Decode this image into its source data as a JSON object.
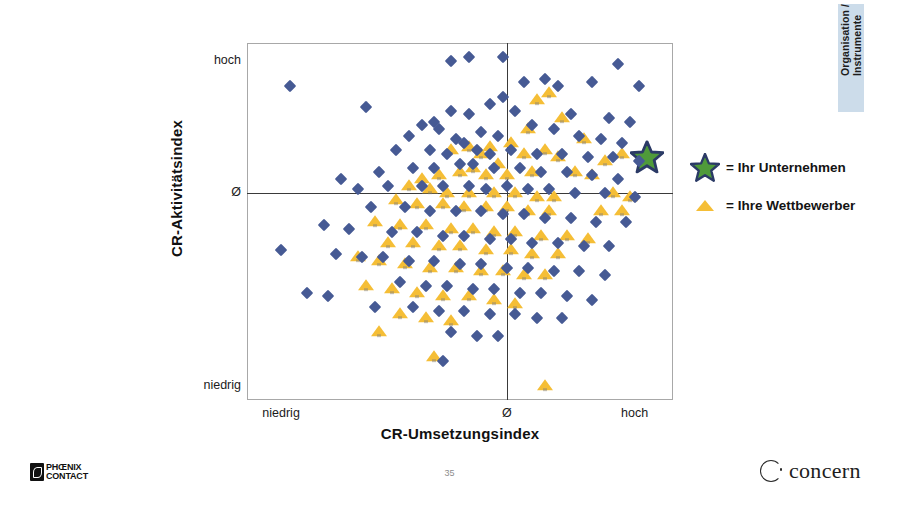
{
  "slide": {
    "page_number": "35",
    "side_tab_label": "Organisation /\nInstrumente",
    "side_tab_color": "#ccdcea"
  },
  "legend": {
    "items": [
      {
        "glyph": "star-icon",
        "label": "= Ihr Unternehmen"
      },
      {
        "glyph": "triangle-icon",
        "label": "= Ihre Wettbewerber"
      }
    ]
  },
  "footer": {
    "brand_left_line1": "PHŒNIX",
    "brand_left_line2": "CONTACT",
    "brand_right": "concern"
  },
  "colors": {
    "competitor": "#f5be36",
    "market": "#465a94",
    "own_company_fill": "#4f9a3a",
    "own_company_outline": "#2b3a66",
    "frame": "#a8a8a8",
    "axis": "#3a3a3a"
  },
  "chart_data": {
    "type": "scatter",
    "title": "",
    "xlabel": "CR-Umsetzungsindex",
    "ylabel": "CR-Aktivitätsindex",
    "xlim": [
      0,
      100
    ],
    "ylim": [
      0,
      100
    ],
    "grid": false,
    "legend_position": "right",
    "xticks": [
      {
        "value": 8,
        "label": "niedrig"
      },
      {
        "value": 61,
        "label": "Ø"
      },
      {
        "value": 91,
        "label": "hoch"
      }
    ],
    "yticks": [
      {
        "value": 95,
        "label": "hoch"
      },
      {
        "value": 58,
        "label": "Ø"
      },
      {
        "value": 4,
        "label": "niedrig"
      }
    ],
    "reference_lines": {
      "x": 61,
      "y": 58
    },
    "series": [
      {
        "name": "Ihr Unternehmen",
        "marker": "star",
        "color": "#4f9a3a",
        "points": [
          [
            94,
            68
          ]
        ]
      },
      {
        "name": "Ihre Wettbewerber",
        "marker": "triangle",
        "color": "#f5be36",
        "points": [
          [
            71,
            86
          ],
          [
            68,
            84
          ],
          [
            74,
            79
          ],
          [
            66,
            76
          ],
          [
            79,
            73
          ],
          [
            62,
            72
          ],
          [
            57,
            71
          ],
          [
            52,
            71
          ],
          [
            48,
            70
          ],
          [
            55,
            69
          ],
          [
            65,
            69
          ],
          [
            70,
            70
          ],
          [
            73,
            68
          ],
          [
            88,
            69
          ],
          [
            84,
            67
          ],
          [
            59,
            66
          ],
          [
            53,
            65
          ],
          [
            50,
            64
          ],
          [
            45,
            63
          ],
          [
            41,
            62
          ],
          [
            56,
            63
          ],
          [
            61,
            63
          ],
          [
            67,
            64
          ],
          [
            77,
            64
          ],
          [
            81,
            63
          ],
          [
            38,
            60
          ],
          [
            43,
            59
          ],
          [
            47,
            58
          ],
          [
            52,
            58
          ],
          [
            58,
            58
          ],
          [
            63,
            58
          ],
          [
            68,
            57
          ],
          [
            72,
            57
          ],
          [
            86,
            58
          ],
          [
            90,
            57
          ],
          [
            35,
            56
          ],
          [
            40,
            55
          ],
          [
            46,
            55
          ],
          [
            51,
            54
          ],
          [
            56,
            54
          ],
          [
            61,
            54
          ],
          [
            66,
            53
          ],
          [
            71,
            53
          ],
          [
            83,
            53
          ],
          [
            88,
            53
          ],
          [
            30,
            50
          ],
          [
            36,
            49
          ],
          [
            42,
            49
          ],
          [
            48,
            48
          ],
          [
            53,
            48
          ],
          [
            58,
            47
          ],
          [
            63,
            47
          ],
          [
            69,
            46
          ],
          [
            75,
            46
          ],
          [
            80,
            45
          ],
          [
            33,
            44
          ],
          [
            39,
            44
          ],
          [
            45,
            43
          ],
          [
            50,
            43
          ],
          [
            56,
            42
          ],
          [
            62,
            42
          ],
          [
            67,
            41
          ],
          [
            73,
            41
          ],
          [
            26,
            40
          ],
          [
            31,
            39
          ],
          [
            37,
            38
          ],
          [
            43,
            37
          ],
          [
            49,
            37
          ],
          [
            55,
            36
          ],
          [
            60,
            36
          ],
          [
            65,
            35
          ],
          [
            70,
            35
          ],
          [
            28,
            32
          ],
          [
            34,
            31
          ],
          [
            40,
            30
          ],
          [
            46,
            29
          ],
          [
            52,
            29
          ],
          [
            58,
            28
          ],
          [
            63,
            27
          ],
          [
            36,
            24
          ],
          [
            42,
            23
          ],
          [
            48,
            22
          ],
          [
            31,
            19
          ],
          [
            44,
            12
          ],
          [
            70,
            4
          ]
        ]
      },
      {
        "name": "Markt",
        "marker": "diamond",
        "color": "#465a94",
        "points": [
          [
            48,
            95
          ],
          [
            52,
            96
          ],
          [
            60,
            96
          ],
          [
            87,
            94
          ],
          [
            70,
            90
          ],
          [
            65,
            89
          ],
          [
            73,
            88
          ],
          [
            81,
            89
          ],
          [
            92,
            88
          ],
          [
            10,
            88
          ],
          [
            28,
            82
          ],
          [
            60,
            85
          ],
          [
            57,
            83
          ],
          [
            48,
            81
          ],
          [
            52,
            80
          ],
          [
            63,
            81
          ],
          [
            76,
            80
          ],
          [
            85,
            79
          ],
          [
            90,
            78
          ],
          [
            44,
            78
          ],
          [
            41,
            77
          ],
          [
            45,
            76
          ],
          [
            67,
            77
          ],
          [
            72,
            76
          ],
          [
            38,
            74
          ],
          [
            55,
            75
          ],
          [
            59,
            74
          ],
          [
            49,
            73
          ],
          [
            51,
            72
          ],
          [
            78,
            74
          ],
          [
            83,
            73
          ],
          [
            88,
            72
          ],
          [
            35,
            70
          ],
          [
            43,
            70
          ],
          [
            47,
            69
          ],
          [
            54,
            70
          ],
          [
            57,
            69
          ],
          [
            62,
            70
          ],
          [
            68,
            69
          ],
          [
            74,
            69
          ],
          [
            80,
            68
          ],
          [
            86,
            68
          ],
          [
            92,
            67
          ],
          [
            22,
            62
          ],
          [
            31,
            64
          ],
          [
            39,
            65
          ],
          [
            44,
            65
          ],
          [
            50,
            66
          ],
          [
            53,
            66
          ],
          [
            58,
            65
          ],
          [
            64,
            65
          ],
          [
            69,
            64
          ],
          [
            75,
            64
          ],
          [
            81,
            63
          ],
          [
            87,
            62
          ],
          [
            26,
            59
          ],
          [
            33,
            60
          ],
          [
            41,
            60
          ],
          [
            46,
            60
          ],
          [
            52,
            60
          ],
          [
            56,
            59
          ],
          [
            61,
            60
          ],
          [
            66,
            59
          ],
          [
            71,
            59
          ],
          [
            77,
            58
          ],
          [
            84,
            58
          ],
          [
            91,
            57
          ],
          [
            29,
            54
          ],
          [
            37,
            54
          ],
          [
            43,
            53
          ],
          [
            49,
            53
          ],
          [
            55,
            53
          ],
          [
            60,
            52
          ],
          [
            65,
            52
          ],
          [
            70,
            51
          ],
          [
            76,
            51
          ],
          [
            82,
            50
          ],
          [
            89,
            50
          ],
          [
            18,
            49
          ],
          [
            24,
            48
          ],
          [
            34,
            47
          ],
          [
            40,
            47
          ],
          [
            46,
            46
          ],
          [
            51,
            46
          ],
          [
            57,
            45
          ],
          [
            62,
            45
          ],
          [
            67,
            44
          ],
          [
            73,
            44
          ],
          [
            79,
            43
          ],
          [
            85,
            43
          ],
          [
            8,
            42
          ],
          [
            21,
            41
          ],
          [
            27,
            40
          ],
          [
            32,
            40
          ],
          [
            38,
            39
          ],
          [
            44,
            39
          ],
          [
            50,
            38
          ],
          [
            55,
            38
          ],
          [
            61,
            37
          ],
          [
            66,
            37
          ],
          [
            72,
            36
          ],
          [
            78,
            36
          ],
          [
            84,
            35
          ],
          [
            14,
            30
          ],
          [
            19,
            29
          ],
          [
            36,
            33
          ],
          [
            42,
            32
          ],
          [
            47,
            32
          ],
          [
            53,
            31
          ],
          [
            58,
            31
          ],
          [
            64,
            30
          ],
          [
            69,
            30
          ],
          [
            75,
            29
          ],
          [
            81,
            28
          ],
          [
            30,
            26
          ],
          [
            39,
            26
          ],
          [
            45,
            25
          ],
          [
            51,
            25
          ],
          [
            57,
            24
          ],
          [
            63,
            24
          ],
          [
            68,
            23
          ],
          [
            74,
            23
          ],
          [
            48,
            19
          ],
          [
            54,
            18
          ],
          [
            59,
            18
          ],
          [
            46,
            11
          ]
        ]
      }
    ]
  }
}
